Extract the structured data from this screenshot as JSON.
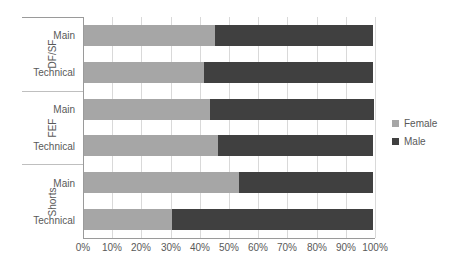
{
  "chart_data": {
    "type": "bar",
    "orientation": "horizontal",
    "stacked": true,
    "stack_mode": "percent",
    "title": "",
    "xlabel": "",
    "ylabel": "",
    "xlim": [
      0,
      100
    ],
    "xtick_labels": [
      "0%",
      "10%",
      "20%",
      "30%",
      "40%",
      "50%",
      "60%",
      "70%",
      "80%",
      "90%",
      "100%"
    ],
    "xtick_values": [
      0,
      10,
      20,
      30,
      40,
      50,
      60,
      70,
      80,
      90,
      100
    ],
    "grid": true,
    "grid_axis": "x",
    "legend": [
      "Female",
      "Male"
    ],
    "legend_position": "right",
    "series": [
      {
        "name": "Female",
        "color": "#a6a6a6",
        "values": [
          45,
          41,
          43,
          46,
          53,
          30
        ]
      },
      {
        "name": "Male",
        "color": "#404040",
        "values": [
          54,
          58,
          56,
          53,
          46,
          69
        ]
      }
    ],
    "groups": [
      {
        "label": "DF/SF",
        "categories": [
          "Main",
          "Technical"
        ],
        "rows": [
          {
            "label": "Main",
            "female": 45,
            "male": 54
          },
          {
            "label": "Technical",
            "female": 41,
            "male": 58
          }
        ]
      },
      {
        "label": "FEF",
        "categories": [
          "Main",
          "Technical"
        ],
        "rows": [
          {
            "label": "Main",
            "female": 43,
            "male": 56
          },
          {
            "label": "Technical",
            "female": 46,
            "male": 53
          }
        ]
      },
      {
        "label": "Shorts",
        "categories": [
          "Main",
          "Technical"
        ],
        "rows": [
          {
            "label": "Main",
            "female": 53,
            "male": 46
          },
          {
            "label": "Technical",
            "female": 30,
            "male": 69
          }
        ]
      }
    ],
    "categories": [
      "DF/SF - Main",
      "DF/SF - Technical",
      "FEF - Main",
      "FEF - Technical",
      "Shorts - Main",
      "Shorts - Technical"
    ]
  },
  "colors": {
    "female": "#a6a6a6",
    "male": "#404040",
    "gridline": "#d9d9d9",
    "axis": "#9a9a9a",
    "text": "#595959",
    "background": "#ffffff"
  }
}
